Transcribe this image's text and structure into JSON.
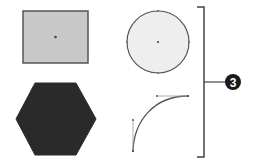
{
  "diagram": {
    "shapes": [
      {
        "name": "rectangle",
        "fill": "#c8c8c8",
        "stroke": "#555555"
      },
      {
        "name": "circle",
        "fill": "#eeeeee",
        "stroke": "#555555"
      },
      {
        "name": "hexagon",
        "fill": "#2a2a2a",
        "stroke": "#2a2a2a"
      },
      {
        "name": "curve-path",
        "fill": "none",
        "stroke": "#555555"
      }
    ],
    "callout": {
      "number": "3",
      "badge_color": "#1a1a1a",
      "text_color": "#ffffff"
    }
  }
}
